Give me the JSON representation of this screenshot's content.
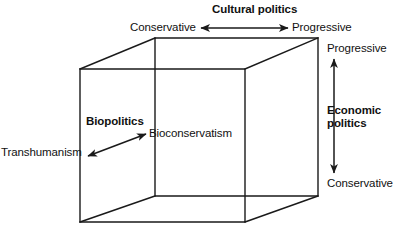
{
  "diagram": {
    "axes": [
      {
        "id": "cultural",
        "name": "Cultural politics",
        "orientation": "horizontal-top",
        "negative_pole": "Conservative",
        "positive_pole": "Progressive"
      },
      {
        "id": "economic",
        "name": "Economic politics",
        "orientation": "vertical-right",
        "positive_pole": "Progressive",
        "negative_pole": "Conservative"
      },
      {
        "id": "biopolitics",
        "name": "Biopolitics",
        "orientation": "diagonal-depth",
        "negative_pole": "Transhumanism",
        "positive_pole": "Bioconservatism"
      }
    ],
    "labels": {
      "cultural_politics": "Cultural politics",
      "cultural_conservative": "Conservative",
      "cultural_progressive": "Progressive",
      "economic_politics_line1": "Economic",
      "economic_politics_line2": "politics",
      "economic_progressive": "Progressive",
      "economic_conservative": "Conservative",
      "biopolitics": "Biopolitics",
      "bioconservatism": "Bioconservatism",
      "transhumanism": "Transhumanism"
    },
    "colors": {
      "stroke": "#1a1a1a",
      "text": "#111111",
      "background": "#ffffff"
    },
    "shape": {
      "type": "wireframe-cube",
      "front_face": {
        "top_left": [
          80,
          69
        ],
        "top_right": [
          245,
          69
        ],
        "bottom_right": [
          245,
          222
        ],
        "bottom_left": [
          80,
          222
        ]
      },
      "back_face": {
        "top_left": [
          155,
          38
        ],
        "top_right": [
          318,
          38
        ],
        "bottom_right": [
          318,
          196
        ],
        "bottom_left": [
          155,
          196
        ]
      }
    }
  }
}
